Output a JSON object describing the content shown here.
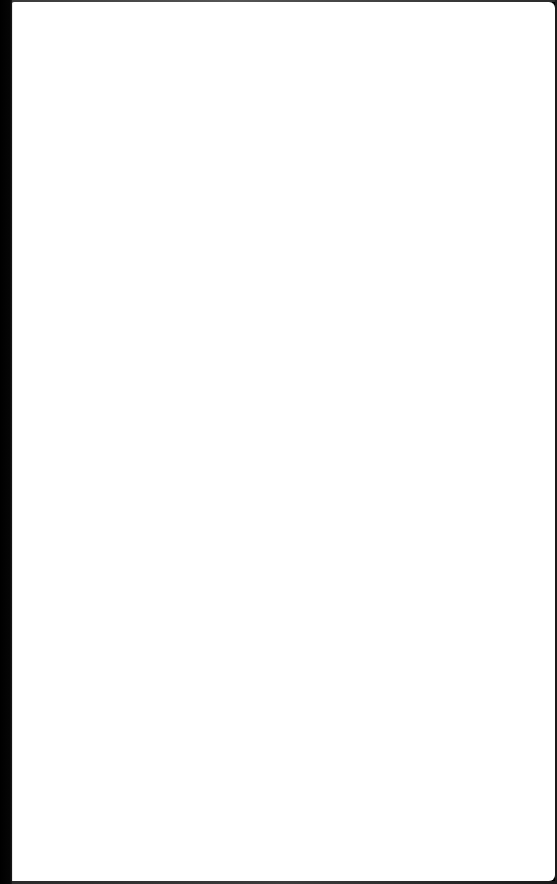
{
  "page": {
    "content": "",
    "background_color": "#ffffff",
    "frame_color": "#000000"
  }
}
